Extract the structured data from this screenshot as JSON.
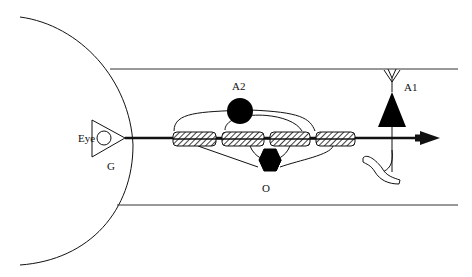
{
  "diagram": {
    "labels": {
      "eye": "Eye",
      "ganglion": "G",
      "amacrine2": "A2",
      "amacrine1": "A1",
      "oligodendrocyte": "O"
    },
    "colors": {
      "stroke": "#111111",
      "fill_dark": "#000000",
      "background": "#ffffff"
    }
  }
}
